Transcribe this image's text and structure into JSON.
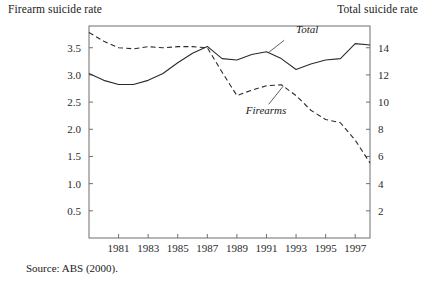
{
  "labels": {
    "left_axis_title": "Firearm suicide rate",
    "right_axis_title": "Total suicide rate",
    "source_note": "Source: ABS (2000)."
  },
  "chart_data": {
    "type": "line",
    "title": "",
    "xlabel": "",
    "ylabel": "Firearm suicide rate",
    "y2label": "Total suicide rate",
    "grid": false,
    "legend": "inline-annotations",
    "xlim": [
      1979,
      1998
    ],
    "ylim": [
      0,
      3.9
    ],
    "y2lim": [
      0,
      15.6
    ],
    "x": [
      1979,
      1980,
      1981,
      1982,
      1983,
      1984,
      1985,
      1986,
      1987,
      1988,
      1989,
      1990,
      1991,
      1992,
      1993,
      1994,
      1995,
      1996,
      1997,
      1998
    ],
    "xticks": [
      1981,
      1983,
      1985,
      1987,
      1989,
      1991,
      1993,
      1995,
      1997
    ],
    "xticklabels": [
      "1981",
      "1983",
      "1985",
      "1987",
      "1989",
      "1991",
      "1993",
      "1995",
      "1997"
    ],
    "yticks": [
      0.5,
      1.0,
      1.5,
      2.0,
      2.5,
      3.0,
      3.5
    ],
    "yticklabels": [
      "0.5",
      "1.0",
      "1.5",
      "2.0",
      "2.5",
      "3.0",
      "3.5"
    ],
    "y2ticks": [
      2,
      4,
      6,
      8,
      10,
      12,
      14
    ],
    "y2ticklabels": [
      "2",
      "4",
      "6",
      "8",
      "10",
      "12",
      "14"
    ],
    "series": [
      {
        "name": "Firearms",
        "axis": "left",
        "style": "dashed",
        "label_text": "Firearms",
        "values": [
          3.78,
          3.62,
          3.5,
          3.48,
          3.52,
          3.5,
          3.52,
          3.52,
          3.5,
          3.05,
          2.62,
          2.72,
          2.8,
          2.82,
          2.62,
          2.35,
          2.18,
          2.12,
          1.8,
          1.38
        ]
      },
      {
        "name": "Total",
        "axis": "right",
        "style": "solid",
        "label_text": "Total",
        "values": [
          12.1,
          11.6,
          11.3,
          11.3,
          11.6,
          12.1,
          12.9,
          13.6,
          14.1,
          13.2,
          13.1,
          13.5,
          13.7,
          13.2,
          12.4,
          12.8,
          13.1,
          13.2,
          14.3,
          14.2
        ]
      }
    ],
    "annotations": [
      {
        "text": "Total",
        "x": 1993.0,
        "y2": 15.1
      },
      {
        "text": "Firearms",
        "x": 1989.6,
        "y": 2.28
      }
    ]
  }
}
